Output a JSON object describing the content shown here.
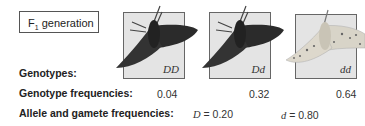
{
  "header": {
    "label_main": "F",
    "label_sub": "1",
    "label_rest": " generation"
  },
  "genotypes": [
    {
      "genotype": "DD",
      "frequency": "0.04",
      "phenotype": "dark"
    },
    {
      "genotype": "Dd",
      "frequency": "0.32",
      "phenotype": "dark"
    },
    {
      "genotype": "dd",
      "frequency": "0.64",
      "phenotype": "light-speckled"
    }
  ],
  "rows": {
    "genotypes_label": "Genotypes:",
    "genotype_freq_label": "Genotype frequencies:",
    "allele_freq_label": "Allele and gamete frequencies:"
  },
  "alleles": [
    {
      "symbol": "D",
      "eq": " = 0.20"
    },
    {
      "symbol": "d",
      "eq": " = 0.80"
    }
  ],
  "colors": {
    "panel_bg": "#e4e4e4",
    "dark_moth": "#2b2b2b",
    "light_moth": "#d8d4c8"
  }
}
